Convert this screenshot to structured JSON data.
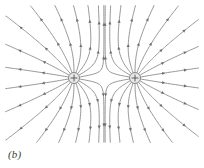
{
  "figure": {
    "panel_label": "(b)",
    "caption_text": "(b)",
    "background_color": "#ffffff",
    "line_color": "#8a8a8a",
    "arrow_color": "#6f6f6f",
    "charge_outline_color": "#7a7a7a",
    "charge_fill_color": "#e8e8e8",
    "charge_symbol_color": "#555555",
    "width": 204,
    "height": 168
  },
  "chart_data": {
    "type": "diagram",
    "subtype": "electric-field-line-map",
    "title": "(b)",
    "xlabel": "",
    "ylabel": "",
    "grid": false,
    "legend": null,
    "xlim": [
      0,
      204
    ],
    "ylim": [
      0,
      168
    ],
    "charges": [
      {
        "name": "left-charge",
        "sign": "+",
        "symbol": "+",
        "x": 74,
        "y": 78,
        "radius": 5.5,
        "magnitude": 1
      },
      {
        "name": "right-charge",
        "sign": "+",
        "symbol": "+",
        "x": 135,
        "y": 78,
        "radius": 5.5,
        "magnitude": 1
      }
    ],
    "field_lines_per_charge": 18,
    "seed_angle_offset_deg": 10,
    "line_width": 0.9,
    "arrowheads_per_line": 2,
    "arrow_direction": "outward",
    "neutral_point": {
      "x": 104.5,
      "y": 78
    },
    "plot_area": {
      "x": 6,
      "y": 6,
      "width": 192,
      "height": 136
    }
  }
}
